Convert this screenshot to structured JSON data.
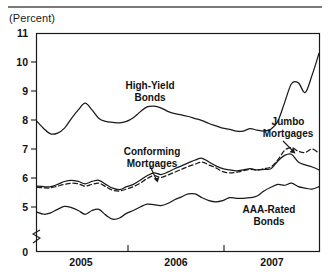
{
  "chart_data": {
    "type": "line",
    "title": "",
    "subtitle": "",
    "unit_label": "(Percent)",
    "xlabel": "",
    "ylabel": "Percent",
    "ylim": [
      4.3,
      11
    ],
    "yticks": [
      11,
      10,
      9,
      8,
      7,
      6,
      5,
      0
    ],
    "ytick_labels": [
      "11",
      "10",
      "9",
      "8",
      "7",
      "6",
      "5",
      "0"
    ],
    "axis_break": true,
    "axis_break_note": "y-axis broken between 0 and 5",
    "grid": false,
    "legend": "none",
    "annotations_as_labels": true,
    "xlim": [
      "2004-07",
      "2007-12"
    ],
    "xticks": [
      "2005",
      "2006",
      "2007"
    ],
    "xtick_labels": [
      "2005",
      "2006",
      "2007"
    ],
    "x": [
      "2004-07",
      "2004-08",
      "2004-09",
      "2004-10",
      "2004-11",
      "2004-12",
      "2005-01",
      "2005-02",
      "2005-03",
      "2005-04",
      "2005-05",
      "2005-06",
      "2005-07",
      "2005-08",
      "2005-09",
      "2005-10",
      "2005-11",
      "2005-12",
      "2006-01",
      "2006-02",
      "2006-03",
      "2006-04",
      "2006-05",
      "2006-06",
      "2006-07",
      "2006-08",
      "2006-09",
      "2006-10",
      "2006-11",
      "2006-12",
      "2007-01",
      "2007-02",
      "2007-03",
      "2007-04",
      "2007-05",
      "2007-06",
      "2007-07",
      "2007-08",
      "2007-09",
      "2007-10",
      "2007-11",
      "2007-12"
    ],
    "series": [
      {
        "name": "High-Yield Bonds",
        "style": "solid",
        "color": "#1a1a1a",
        "values": [
          7.95,
          7.7,
          7.52,
          7.55,
          7.72,
          8.05,
          8.35,
          8.58,
          8.35,
          8.05,
          7.95,
          7.92,
          7.9,
          7.95,
          8.08,
          8.28,
          8.45,
          8.48,
          8.42,
          8.3,
          8.22,
          8.18,
          8.12,
          8.05,
          7.98,
          7.88,
          7.8,
          7.72,
          7.68,
          7.62,
          7.62,
          7.7,
          7.65,
          7.62,
          7.68,
          7.95,
          8.6,
          9.25,
          9.28,
          8.95,
          9.55,
          10.3
        ]
      },
      {
        "name": "Conforming Mortgages",
        "style": "solid",
        "color": "#1a1a1a",
        "values": [
          5.72,
          5.7,
          5.7,
          5.78,
          5.88,
          5.92,
          5.88,
          5.8,
          5.88,
          5.92,
          5.78,
          5.65,
          5.6,
          5.7,
          5.78,
          5.92,
          6.08,
          6.18,
          6.12,
          6.2,
          6.32,
          6.42,
          6.52,
          6.62,
          6.68,
          6.55,
          6.42,
          6.32,
          6.28,
          6.25,
          6.28,
          6.32,
          6.28,
          6.3,
          6.32,
          6.58,
          6.78,
          6.82,
          6.55,
          6.45,
          6.38,
          6.28
        ]
      },
      {
        "name": "Jumbo Mortgages",
        "style": "dashed",
        "color": "#1a1a1a",
        "values": [
          5.68,
          5.66,
          5.66,
          5.72,
          5.78,
          5.82,
          5.8,
          5.72,
          5.78,
          5.82,
          5.7,
          5.58,
          5.55,
          5.62,
          5.7,
          5.82,
          5.98,
          6.08,
          6.02,
          6.1,
          6.2,
          6.3,
          6.4,
          6.48,
          6.55,
          6.45,
          6.35,
          6.22,
          6.18,
          6.2,
          6.25,
          6.3,
          6.28,
          6.32,
          6.38,
          6.62,
          6.95,
          7.05,
          6.92,
          6.88,
          7.0,
          6.85
        ]
      },
      {
        "name": "AAA-Rated Bonds",
        "style": "solid",
        "color": "#1a1a1a",
        "values": [
          4.82,
          4.75,
          4.8,
          4.92,
          5.02,
          4.98,
          4.88,
          4.75,
          4.88,
          4.92,
          4.72,
          4.58,
          4.62,
          4.78,
          4.88,
          5.0,
          5.1,
          5.08,
          5.05,
          5.12,
          5.25,
          5.35,
          5.45,
          5.45,
          5.32,
          5.22,
          5.18,
          5.22,
          5.32,
          5.3,
          5.3,
          5.32,
          5.38,
          5.55,
          5.68,
          5.78,
          5.75,
          5.82,
          5.7,
          5.65,
          5.62,
          5.7
        ]
      }
    ],
    "annotations": [
      {
        "text": "High-Yield\nBonds",
        "line1": "High-Yield",
        "line2": "Bonds",
        "x": 150,
        "y": 88,
        "arrow": false
      },
      {
        "text": "Conforming\nMortgages",
        "line1": "Conforming",
        "line2": "Mortgages",
        "x": 152,
        "y": 152,
        "arrow": true
      },
      {
        "text": "Jumbo\nMortgages",
        "line1": "Jumbo",
        "line2": "Mortgages",
        "x": 290,
        "y": 122,
        "arrow": true
      },
      {
        "text": "AAA-Rated\nBonds",
        "line1": "AAA-Rated",
        "line2": "Bonds",
        "x": 268,
        "y": 210,
        "arrow": false
      }
    ]
  },
  "axis": {
    "yticks": [
      {
        "label": "11",
        "top": 28
      },
      {
        "label": "10",
        "top": 57
      },
      {
        "label": "9",
        "top": 86
      },
      {
        "label": "8",
        "top": 115
      },
      {
        "label": "7",
        "top": 144
      },
      {
        "label": "6",
        "top": 173
      },
      {
        "label": "5",
        "top": 202
      },
      {
        "label": "0",
        "top": 247
      }
    ],
    "xticks": [
      {
        "label": "2005",
        "left": 51
      },
      {
        "label": "2006",
        "left": 146
      },
      {
        "label": "2007",
        "left": 242
      }
    ]
  },
  "labels": {
    "unit": "(Percent)",
    "high_yield_l1": "High-Yield",
    "high_yield_l2": "Bonds",
    "conforming_l1": "Conforming",
    "conforming_l2": "Mortgages",
    "jumbo_l1": "Jumbo",
    "jumbo_l2": "Mortgages",
    "aaa_l1": "AAA-Rated",
    "aaa_l2": "Bonds"
  }
}
